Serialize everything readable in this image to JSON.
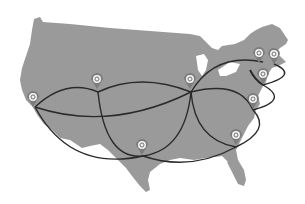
{
  "map": {
    "region": "United States",
    "land_color": "#9a9a9a",
    "route_color": "#2a2a2a",
    "pin_color": "#7d7d7d",
    "pin_inner_color": "#f2f2f2",
    "pin_icon": "coin-icon"
  },
  "pins": [
    {
      "id": "west-coast",
      "x": 33,
      "y": 97
    },
    {
      "id": "mountain",
      "x": 97,
      "y": 79
    },
    {
      "id": "midwest",
      "x": 190,
      "y": 79
    },
    {
      "id": "northeast-1",
      "x": 259,
      "y": 53
    },
    {
      "id": "northeast-2",
      "x": 274,
      "y": 54
    },
    {
      "id": "new-york",
      "x": 263,
      "y": 74
    },
    {
      "id": "mid-atlantic",
      "x": 253,
      "y": 99
    },
    {
      "id": "southeast",
      "x": 236,
      "y": 135
    },
    {
      "id": "texas",
      "x": 142,
      "y": 145
    }
  ],
  "routes": [
    {
      "from": "west-coast",
      "to": "mountain"
    },
    {
      "from": "west-coast",
      "to": "midwest"
    },
    {
      "from": "west-coast",
      "to": "texas"
    },
    {
      "from": "mountain",
      "to": "midwest"
    },
    {
      "from": "mountain",
      "to": "texas"
    },
    {
      "from": "midwest",
      "to": "texas"
    },
    {
      "from": "midwest",
      "to": "new-york"
    },
    {
      "from": "midwest",
      "to": "mid-atlantic"
    },
    {
      "from": "midwest",
      "to": "southeast"
    },
    {
      "from": "texas",
      "to": "southeast"
    },
    {
      "from": "new-york",
      "to": "northeast"
    },
    {
      "from": "mid-atlantic",
      "to": "new-york"
    },
    {
      "from": "southeast",
      "to": "mid-atlantic"
    }
  ]
}
